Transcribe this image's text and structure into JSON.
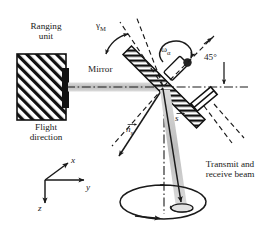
{
  "figure": {
    "background_color": "#ffffff",
    "line_color": "#1a1a1a",
    "beam_color": "#c9c9c9"
  },
  "labels": {
    "ranging_unit": "Ranging\nunit",
    "flight_direction": "Flight\ndirection",
    "mirror": "Mirror",
    "transmit_receive_beam": "Transmit and\nreceive beam",
    "angle_45": "45°",
    "gamma_mirror_base": "γ",
    "gamma_mirror_sub": "M",
    "omega_base": "ω",
    "omega_sub": "α",
    "vector_n": "n",
    "vector_n_sub": "s",
    "vector_s": "s"
  },
  "axes": {
    "x": "x",
    "y": "y",
    "z": "z"
  },
  "annotations": {
    "mirror_tilt_deg": 45,
    "scan_cone": "rotation circle",
    "rotation_arrow": "counter-clockwise scan rotation"
  }
}
